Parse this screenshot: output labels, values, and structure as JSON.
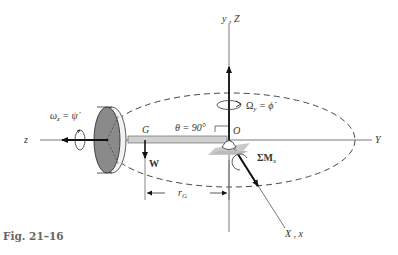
{
  "figure": {
    "caption": "Fig. 21–16",
    "labels": {
      "vertical_axis": "y , Z",
      "horizontal_axis_right": "Y",
      "horizontal_axis_left": "z",
      "diagonal_axis": "X , x",
      "origin": "O",
      "center_of_mass": "G",
      "angle": "θ = 90°",
      "weight": "W",
      "radius": "r",
      "radius_sub": "G",
      "spin": "ω",
      "spin_sub": "z",
      "spin_eq": " = ψ̇",
      "precession": "Ω",
      "precession_sub": "y",
      "precession_eq": " = ϕ̇",
      "moment": "ΣM",
      "moment_sub": "x"
    },
    "colors": {
      "line": "#222222",
      "disk_face": "#8a8a8a",
      "disk_rim": "#f2f2f2",
      "rod": "#d0d0d0",
      "support": "#b8b8b8",
      "caption": "#666666"
    }
  }
}
